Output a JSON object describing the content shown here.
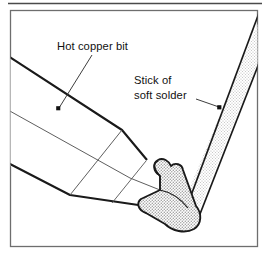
{
  "figure": {
    "kind": "technical-line-illustration",
    "background_color": "#ffffff",
    "top_rule": {
      "color": "#4a4a4a"
    },
    "frame": {
      "border_color": "#6e6e6e",
      "fill_color": "#ffffff"
    },
    "colors": {
      "outline_dark": "#1a1a1a",
      "outline_thin": "#555555",
      "solder_fill": "#d8d8d8",
      "solder_stick_fill": "#e2e2e2",
      "blob_fill": "#d5d5d5",
      "leader_line": "#333333",
      "marker_dot": "#111111"
    },
    "labels": [
      {
        "id": "hot-copper-bit",
        "lines": [
          "Hot copper bit"
        ],
        "marker_dot": true
      },
      {
        "id": "stick-of-soft-solder",
        "lines": [
          "Stick of",
          "soft solder"
        ],
        "marker_dot": true
      }
    ]
  }
}
